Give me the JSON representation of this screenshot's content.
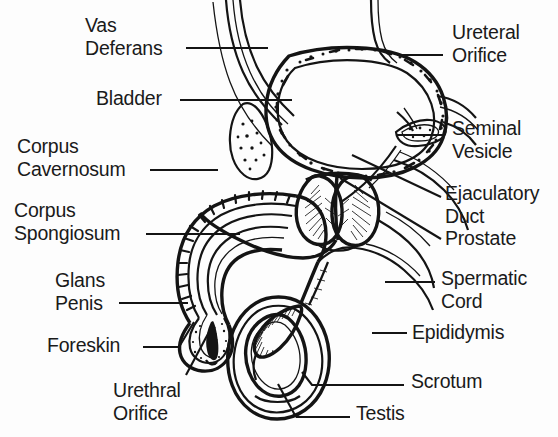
{
  "figure": {
    "background_color": "#fdfdfd",
    "ink_color": "#141414",
    "style": "black-and-white line drawing, scanned textbook illustration"
  },
  "labels": {
    "left": [
      {
        "id": "vas-deferans",
        "text": "Vas\nDeferans",
        "x": 85,
        "y": 16,
        "align": "left",
        "leader": {
          "x1": 186,
          "y1": 48,
          "x2": 268,
          "y2": 48
        }
      },
      {
        "id": "bladder",
        "text": "Bladder",
        "x": 96,
        "y": 88,
        "align": "left",
        "leader": {
          "x1": 180,
          "y1": 100,
          "x2": 290,
          "y2": 100
        }
      },
      {
        "id": "corpus-cavernosum",
        "text": "Corpus\nCavernosum",
        "x": 17,
        "y": 136,
        "align": "left",
        "leader": {
          "x1": 150,
          "y1": 170,
          "x2": 218,
          "y2": 170
        }
      },
      {
        "id": "corpus-spongiosum",
        "text": "Corpus\nSpongiosum",
        "x": 14,
        "y": 200,
        "align": "left",
        "leader": {
          "x1": 146,
          "y1": 234,
          "x2": 238,
          "y2": 234
        }
      },
      {
        "id": "glans-penis",
        "text": "Glans\nPenis",
        "x": 55,
        "y": 270,
        "align": "left",
        "leader": {
          "x1": 119,
          "y1": 303,
          "x2": 186,
          "y2": 303
        }
      },
      {
        "id": "foreskin",
        "text": "Foreskin",
        "x": 47,
        "y": 335,
        "align": "left",
        "leader": {
          "x1": 143,
          "y1": 347,
          "x2": 179,
          "y2": 347,
          "bend_x": 193,
          "bend_y": 322
        }
      },
      {
        "id": "urethral-orifice",
        "text": "Urethral\nOrifice",
        "x": 113,
        "y": 380,
        "align": "left",
        "leader": {
          "x1": 186,
          "y1": 375,
          "x2": 205,
          "y2": 330
        }
      }
    ],
    "right": [
      {
        "id": "ureteral-orifice",
        "text": "Ureteral\nOrifice",
        "x": 452,
        "y": 22,
        "align": "left",
        "leader": {
          "x1": 397,
          "y1": 55,
          "x2": 443,
          "y2": 55
        }
      },
      {
        "id": "seminal-vesicle",
        "text": "Seminal\nVesicle",
        "x": 452,
        "y": 118,
        "align": "left",
        "leader": {
          "x1": 396,
          "y1": 135,
          "x2": 444,
          "y2": 135
        }
      },
      {
        "id": "ejaculatory-duct",
        "text": "Ejaculatory\nDuct",
        "x": 445,
        "y": 183,
        "align": "left",
        "leader": {
          "x1": 352,
          "y1": 155,
          "x2": 440,
          "y2": 196
        }
      },
      {
        "id": "prostate",
        "text": "Prostate",
        "x": 445,
        "y": 228,
        "align": "left",
        "leader": {
          "x1": 340,
          "y1": 178,
          "x2": 440,
          "y2": 238
        }
      },
      {
        "id": "spermatic-cord",
        "text": "Spermatic\nCord",
        "x": 441,
        "y": 268,
        "align": "left",
        "leader": {
          "x1": 385,
          "y1": 282,
          "x2": 434,
          "y2": 282
        }
      },
      {
        "id": "epididymis",
        "text": "Epididymis",
        "x": 412,
        "y": 322,
        "align": "left",
        "leader": {
          "x1": 372,
          "y1": 333,
          "x2": 406,
          "y2": 333
        }
      },
      {
        "id": "scrotum",
        "text": "Scrotum",
        "x": 411,
        "y": 371,
        "align": "left",
        "leader": {
          "x1": 308,
          "y1": 384,
          "x2": 404,
          "y2": 384
        }
      },
      {
        "id": "testis",
        "text": "Testis",
        "x": 356,
        "y": 403,
        "align": "left",
        "leader": {
          "x1": 296,
          "y1": 416,
          "x2": 350,
          "y2": 416
        }
      }
    ]
  },
  "anatomy_parts": [
    "bladder",
    "vas deferens",
    "ureter",
    "seminal vesicle",
    "ejaculatory duct",
    "prostate",
    "urethra",
    "corpus cavernosum",
    "corpus spongiosum",
    "glans penis",
    "foreskin",
    "urethral orifice",
    "spermatic cord",
    "epididymis",
    "testis",
    "scrotum",
    "pubic bone"
  ]
}
